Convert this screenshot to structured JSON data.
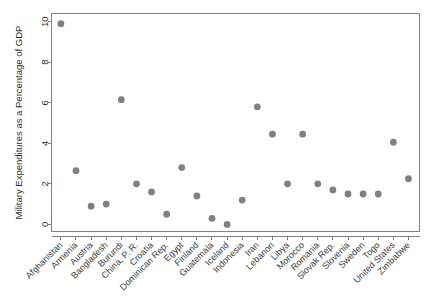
{
  "chart_data": {
    "type": "scatter",
    "title": "",
    "xlabel": "",
    "ylabel": "Military Expenditures as a Percentage of GDP",
    "ylim": [
      -0.35,
      10.4
    ],
    "yticks": [
      0,
      2,
      4,
      6,
      8,
      10
    ],
    "ytick_labels": [
      "0",
      "2",
      "4",
      "6",
      "8",
      "10"
    ],
    "grid": false,
    "legend": "none",
    "marker": {
      "shape": "circle",
      "color": "#808080",
      "size": 3.4
    },
    "categories": [
      "Afghanistan",
      "Armenia",
      "Austria",
      "Bangladesh",
      "Burundi",
      "China, P. R.",
      "Croatia",
      "Dominican Rep.",
      "Egypt",
      "Finland",
      "Guatemala",
      "Iceland",
      "Indonesia",
      "Iran",
      "Lebanon",
      "Libya",
      "Morocco",
      "Romania",
      "Slovak Rep.",
      "Slovenia",
      "Sweden",
      "Togo",
      "United States",
      "Zimbabwe"
    ],
    "values": [
      9.9,
      2.65,
      0.9,
      1.0,
      6.15,
      2.0,
      1.6,
      0.5,
      2.8,
      1.4,
      0.3,
      0.0,
      1.2,
      5.8,
      4.45,
      2.0,
      4.45,
      2.0,
      1.7,
      1.5,
      1.5,
      1.5,
      4.05,
      2.25
    ]
  }
}
